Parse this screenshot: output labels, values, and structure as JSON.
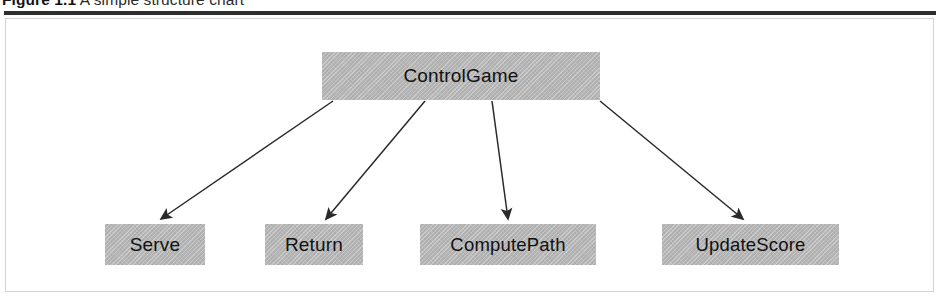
{
  "caption": {
    "figure_number": "Figure 1.1",
    "title": "A simple structure chart",
    "full_text": "Figure 1.1  A simple structure chart"
  },
  "figure": {
    "type": "structure-chart",
    "root": "ControlGame",
    "nodes": [
      {
        "id": "controlgame",
        "label": "ControlGame",
        "level": 0
      },
      {
        "id": "serve",
        "label": "Serve",
        "level": 1
      },
      {
        "id": "return",
        "label": "Return",
        "level": 1
      },
      {
        "id": "computepath",
        "label": "ComputePath",
        "level": 1
      },
      {
        "id": "updatescore",
        "label": "UpdateScore",
        "level": 1
      }
    ],
    "edges": [
      {
        "from": "ControlGame",
        "to": "Serve"
      },
      {
        "from": "ControlGame",
        "to": "Return"
      },
      {
        "from": "ControlGame",
        "to": "ComputePath"
      },
      {
        "from": "ControlGame",
        "to": "UpdateScore"
      }
    ],
    "colors": {
      "box_fill": "#b4b4b4",
      "box_text": "#111111",
      "arrow": "#2a2a2a",
      "frame_border": "#d2d2d2",
      "rule": "#2e2e2e",
      "background": "#ffffff"
    }
  }
}
